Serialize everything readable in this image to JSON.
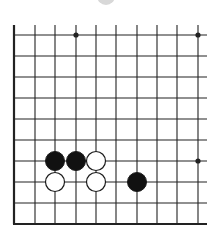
{
  "diagram": {
    "type": "go-board-fragment",
    "background": "#ffffff",
    "line_color": "#222222",
    "grid": {
      "x": [
        14,
        35,
        55,
        76,
        96,
        116,
        137,
        157,
        177,
        198
      ],
      "y": [
        35,
        56,
        77,
        98,
        119,
        140,
        161,
        182,
        203,
        224
      ],
      "vertical_top": 25,
      "horizontal_right": 207,
      "edges": [
        "left",
        "bottom"
      ]
    },
    "star_points": [
      {
        "col": 3,
        "row": 0
      },
      {
        "col": 9,
        "row": 0
      },
      {
        "col": 9,
        "row": 6
      }
    ],
    "stones": [
      {
        "color": "black",
        "col": 2,
        "row": 6
      },
      {
        "color": "black",
        "col": 3,
        "row": 6
      },
      {
        "color": "white",
        "col": 4,
        "row": 6
      },
      {
        "color": "white",
        "col": 2,
        "row": 7
      },
      {
        "color": "white",
        "col": 4,
        "row": 7
      },
      {
        "color": "black",
        "col": 6,
        "row": 7
      }
    ],
    "stone_radius": 9.5,
    "top_artifact": {
      "cx": 106,
      "cy": -4,
      "r": 9,
      "color": "#d8d8d8"
    }
  }
}
